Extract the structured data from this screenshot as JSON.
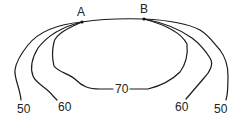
{
  "diagram": {
    "type": "contour-lines",
    "points": [
      {
        "id": "A",
        "label": "A",
        "x": 82,
        "y": 22
      },
      {
        "id": "B",
        "label": "B",
        "x": 144,
        "y": 19
      }
    ],
    "contours": [
      {
        "id": "left-50",
        "label": "50",
        "side": "left"
      },
      {
        "id": "left-60",
        "label": "60",
        "side": "left"
      },
      {
        "id": "loop-70",
        "label": "70",
        "side": "center"
      },
      {
        "id": "right-60",
        "label": "60",
        "side": "right"
      },
      {
        "id": "right-50",
        "label": "50",
        "side": "right"
      }
    ],
    "colors": {
      "line": "#1a1a1a",
      "text": "#222222",
      "background": "#ffffff"
    }
  }
}
